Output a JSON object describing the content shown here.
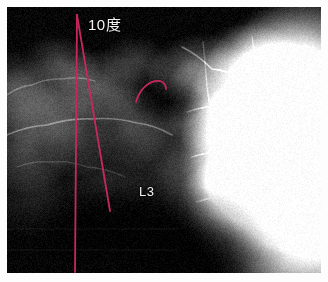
{
  "image": {
    "modality": "x-ray",
    "view": "lumbar-spine-lateral",
    "background_color": "#060606",
    "border_color": "#ffffff"
  },
  "annotations": {
    "angle_label": {
      "text": "10度",
      "value": 10,
      "unit": "度",
      "color": "#f2f2f2",
      "x": 88,
      "y": 13
    },
    "vertebra_label": {
      "text": "L3",
      "color": "#e8e8e8",
      "x": 139,
      "y": 184
    },
    "measurement_color": "#c7285c",
    "lines": [
      {
        "name": "anterior-reference-line",
        "x1": 77,
        "y1": 15,
        "x2": 75,
        "y2": 272,
        "color": "#c7285c",
        "width": 1.8
      },
      {
        "name": "posterior-tangent-line",
        "x1": 77,
        "y1": 15,
        "x2": 110,
        "y2": 211,
        "color": "#c7285c",
        "width": 1.8
      }
    ],
    "arc": {
      "name": "vertebral-endplate-arc",
      "path": "M 136 102 C 140 88, 150 80, 160 81 C 164 82, 166 85, 166 89",
      "color": "#c7285c",
      "width": 1.8
    }
  }
}
